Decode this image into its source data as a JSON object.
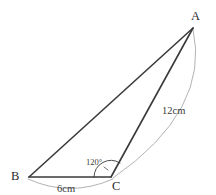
{
  "figure": {
    "kind": "geometry-diagram",
    "background_color": "#ffffff",
    "width": 216,
    "height": 195
  },
  "vertices": [
    {
      "id": "A",
      "label": "A",
      "x": 193,
      "y": 28
    },
    {
      "id": "B",
      "label": "B",
      "x": 29,
      "y": 177
    },
    {
      "id": "C",
      "label": "C",
      "x": 111,
      "y": 177
    }
  ],
  "edges": [
    {
      "id": "BA",
      "from": "B",
      "to": "A",
      "color": "#3a3a3a",
      "width": 1.6
    },
    {
      "id": "BC",
      "from": "B",
      "to": "C",
      "color": "#3a3a3a",
      "width": 1.6
    },
    {
      "id": "CA",
      "from": "C",
      "to": "A",
      "color": "#3a3a3a",
      "width": 1.6
    }
  ],
  "measures": [
    {
      "id": "side-CA",
      "label": "12cm",
      "value": 12,
      "unit": "cm",
      "applies_to": "CA",
      "label_x": 174,
      "label_y": 112,
      "arc_color": "#a9a9a9"
    },
    {
      "id": "side-BC",
      "label": "6cm",
      "value": 6,
      "unit": "cm",
      "applies_to": "BC",
      "label_x": 68,
      "label_y": 190,
      "arc_color": "#a9a9a9"
    }
  ],
  "angles": [
    {
      "id": "angle-BCA",
      "label": "120°",
      "value": 120,
      "unit": "degrees",
      "at_vertex": "C",
      "between": [
        "CB",
        "CA"
      ],
      "label_x": 96,
      "label_y": 164,
      "arc_color": "#3a3a3a"
    }
  ],
  "colors": {
    "line": "#3a3a3a",
    "measure_arc": "#a9a9a9",
    "text": "#2b2b2b",
    "background": "#ffffff"
  }
}
